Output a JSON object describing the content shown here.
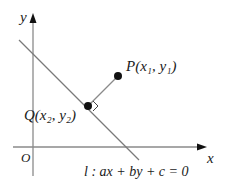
{
  "diagram": {
    "axes": {
      "x_label": "x",
      "y_label": "y",
      "origin_label": "O"
    },
    "line": {
      "name": "l",
      "equation": "l : ax + by + c = 0"
    },
    "points": [
      {
        "name": "P",
        "label": "P(x₁, y₁)"
      },
      {
        "name": "Q",
        "label": "Q(x₂, y₂)"
      }
    ],
    "annotations": {
      "right_angle_at": "Q"
    },
    "colors": {
      "axis": "#888888",
      "line": "#777777",
      "segment": "#888888",
      "point": "#111111",
      "text": "#1a1a1a"
    }
  }
}
